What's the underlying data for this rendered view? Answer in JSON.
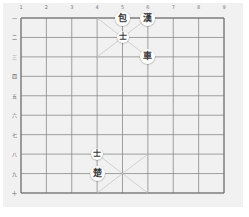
{
  "board": {
    "title": "Xiangqi board",
    "column_labels": [
      "1",
      "2",
      "3",
      "4",
      "5",
      "6",
      "7",
      "8",
      "9"
    ],
    "row_labels": [
      "一",
      "二",
      "三",
      "四",
      "五",
      "六",
      "七",
      "八",
      "九",
      "十"
    ],
    "grid": {
      "left": 21,
      "top": 18,
      "right": 224,
      "bottom": 193,
      "cols": 9,
      "rows": 10
    },
    "colors": {
      "background": "#f1f1f1",
      "line": "#8a8a8a",
      "palace_line": "#c8c8c8",
      "piece_fill": "#ffffff",
      "piece_text": "#3a3a3a"
    }
  },
  "pieces": [
    {
      "char": "包",
      "name": "cannon",
      "col": 5,
      "row": 1,
      "size": "normal"
    },
    {
      "char": "漢",
      "name": "general-han",
      "col": 6,
      "row": 1,
      "size": "normal"
    },
    {
      "char": "士",
      "name": "advisor",
      "col": 5,
      "row": 2,
      "size": "small"
    },
    {
      "char": "車",
      "name": "chariot",
      "col": 6,
      "row": 3,
      "size": "normal"
    },
    {
      "char": "士",
      "name": "advisor",
      "col": 4,
      "row": 8,
      "size": "small"
    },
    {
      "char": "楚",
      "name": "general-chu",
      "col": 4,
      "row": 9,
      "size": "normal"
    }
  ]
}
